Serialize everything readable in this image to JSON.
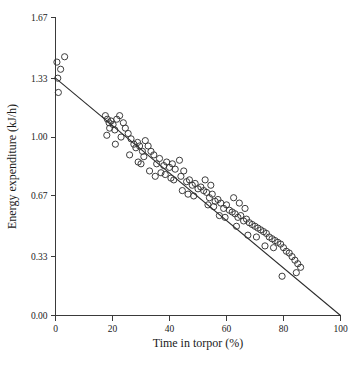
{
  "chart_data": {
    "type": "scatter",
    "title": "",
    "xlabel": "Time in torpor (%)",
    "ylabel": "Energy expenditure (kJ/h)",
    "xlim": [
      0,
      100
    ],
    "ylim": [
      0.0,
      1.67
    ],
    "grid": false,
    "legend": null,
    "xticks": [
      "0",
      "20",
      "40",
      "60",
      "80",
      "100"
    ],
    "xtick_values": [
      0,
      20,
      40,
      60,
      80,
      100
    ],
    "yticks": [
      "0.00",
      "0.33",
      "0.67",
      "1.00",
      "1.33",
      "1.67"
    ],
    "ytick_values": [
      0.0,
      0.33,
      0.67,
      1.0,
      1.33,
      1.67
    ],
    "series": [
      {
        "name": "Observations",
        "marker": "open-circle",
        "color": "#333333",
        "points": [
          [
            0.5,
            1.42
          ],
          [
            1.8,
            1.38
          ],
          [
            3.2,
            1.45
          ],
          [
            0.8,
            1.33
          ],
          [
            1.0,
            1.25
          ],
          [
            17.5,
            1.12
          ],
          [
            18.2,
            1.1
          ],
          [
            18.8,
            1.08
          ],
          [
            19.5,
            1.09
          ],
          [
            19.0,
            1.05
          ],
          [
            20.2,
            1.07
          ],
          [
            20.8,
            1.04
          ],
          [
            21.5,
            1.1
          ],
          [
            22.5,
            1.12
          ],
          [
            23.8,
            1.08
          ],
          [
            24.5,
            1.05
          ],
          [
            18.0,
            1.01
          ],
          [
            21.0,
            0.96
          ],
          [
            25.5,
            1.02
          ],
          [
            26.5,
            0.99
          ],
          [
            27.5,
            0.96
          ],
          [
            28.2,
            0.94
          ],
          [
            28.8,
            0.97
          ],
          [
            29.5,
            0.95
          ],
          [
            30.5,
            0.92
          ],
          [
            31.5,
            0.98
          ],
          [
            32.5,
            0.95
          ],
          [
            33.5,
            0.92
          ],
          [
            31.0,
            0.89
          ],
          [
            34.5,
            0.9
          ],
          [
            29.0,
            0.86
          ],
          [
            30.0,
            0.85
          ],
          [
            35.5,
            0.85
          ],
          [
            36.5,
            0.88
          ],
          [
            38.0,
            0.84
          ],
          [
            39.0,
            0.86
          ],
          [
            40.0,
            0.83
          ],
          [
            41.0,
            0.85
          ],
          [
            42.0,
            0.82
          ],
          [
            37.0,
            0.8
          ],
          [
            38.5,
            0.79
          ],
          [
            43.5,
            0.87
          ],
          [
            45.0,
            0.81
          ],
          [
            40.5,
            0.77
          ],
          [
            41.5,
            0.76
          ],
          [
            44.0,
            0.78
          ],
          [
            46.0,
            0.75
          ],
          [
            47.0,
            0.76
          ],
          [
            48.0,
            0.73
          ],
          [
            49.0,
            0.74
          ],
          [
            50.0,
            0.71
          ],
          [
            51.0,
            0.72
          ],
          [
            52.0,
            0.7
          ],
          [
            46.5,
            0.68
          ],
          [
            48.5,
            0.67
          ],
          [
            53.0,
            0.69
          ],
          [
            54.0,
            0.66
          ],
          [
            55.0,
            0.68
          ],
          [
            56.0,
            0.64
          ],
          [
            57.0,
            0.65
          ],
          [
            53.5,
            0.62
          ],
          [
            55.5,
            0.61
          ],
          [
            58.0,
            0.63
          ],
          [
            59.0,
            0.6
          ],
          [
            60.0,
            0.62
          ],
          [
            61.0,
            0.59
          ],
          [
            62.0,
            0.58
          ],
          [
            57.5,
            0.56
          ],
          [
            59.5,
            0.55
          ],
          [
            63.0,
            0.57
          ],
          [
            64.0,
            0.55
          ],
          [
            65.0,
            0.56
          ],
          [
            66.0,
            0.53
          ],
          [
            67.0,
            0.54
          ],
          [
            68.0,
            0.52
          ],
          [
            63.5,
            0.5
          ],
          [
            69.0,
            0.51
          ],
          [
            70.0,
            0.5
          ],
          [
            71.0,
            0.49
          ],
          [
            72.0,
            0.48
          ],
          [
            73.0,
            0.47
          ],
          [
            67.5,
            0.45
          ],
          [
            70.5,
            0.44
          ],
          [
            74.0,
            0.46
          ],
          [
            75.0,
            0.44
          ],
          [
            76.0,
            0.43
          ],
          [
            77.0,
            0.42
          ],
          [
            78.0,
            0.41
          ],
          [
            73.5,
            0.39
          ],
          [
            76.5,
            0.38
          ],
          [
            79.0,
            0.4
          ],
          [
            80.0,
            0.38
          ],
          [
            81.0,
            0.36
          ],
          [
            82.0,
            0.35
          ],
          [
            83.0,
            0.33
          ],
          [
            84.0,
            0.31
          ],
          [
            85.0,
            0.29
          ],
          [
            86.0,
            0.27
          ],
          [
            84.5,
            0.24
          ],
          [
            79.5,
            0.22
          ],
          [
            62.5,
            0.66
          ],
          [
            64.5,
            0.63
          ],
          [
            66.5,
            0.6
          ],
          [
            54.5,
            0.73
          ],
          [
            52.5,
            0.76
          ],
          [
            44.5,
            0.7
          ],
          [
            35.0,
            0.78
          ],
          [
            33.0,
            0.81
          ],
          [
            26.0,
            0.9
          ],
          [
            23.0,
            1.0
          ]
        ]
      }
    ],
    "fit_line": {
      "name": "Linear regression",
      "x_start": 0,
      "y_start": 1.33,
      "x_end": 100,
      "y_end": 0.0
    }
  },
  "caption": {
    "text": ""
  }
}
